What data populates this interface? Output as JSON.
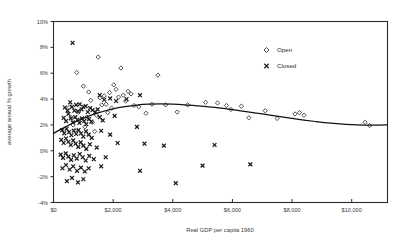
{
  "chart_data": {
    "type": "scatter",
    "title": "",
    "xlabel": "Real GDP per capita 1960",
    "ylabel": "average annual % growth",
    "xlim": [
      0,
      11200
    ],
    "ylim": [
      -4,
      10
    ],
    "grid": false,
    "legend_position": "top-right",
    "x_tick_labels": [
      "$0",
      "$2,000",
      "$4,000",
      "$6,000",
      "$8,000",
      "$10,000"
    ],
    "x_tick_values": [
      0,
      2000,
      4000,
      6000,
      8000,
      10000
    ],
    "y_tick_labels": [
      "10%",
      "8%",
      "6%",
      "4%",
      "2%",
      "0%",
      "-2%",
      "-4%"
    ],
    "y_tick_values": [
      10,
      8,
      6,
      4,
      2,
      0,
      -2,
      -4
    ],
    "series": [
      {
        "name": "Open",
        "marker": "diamond-open",
        "points": [
          [
            780,
            6.05
          ],
          [
            1000,
            5.0
          ],
          [
            1180,
            4.55
          ],
          [
            1250,
            3.9
          ],
          [
            1500,
            7.25
          ],
          [
            1560,
            4.1
          ],
          [
            1620,
            3.55
          ],
          [
            1700,
            4.25
          ],
          [
            1760,
            3.6
          ],
          [
            1820,
            2.95
          ],
          [
            1880,
            4.5
          ],
          [
            1950,
            3.3
          ],
          [
            2020,
            5.1
          ],
          [
            2100,
            4.75
          ],
          [
            2180,
            4.15
          ],
          [
            2260,
            6.4
          ],
          [
            2340,
            4.3
          ],
          [
            2420,
            3.85
          ],
          [
            2500,
            4.6
          ],
          [
            2600,
            4.4
          ],
          [
            2700,
            3.5
          ],
          [
            2860,
            3.4
          ],
          [
            3100,
            2.9
          ],
          [
            3300,
            3.6
          ],
          [
            3500,
            5.85
          ],
          [
            3760,
            3.55
          ],
          [
            4150,
            3.0
          ],
          [
            4500,
            3.55
          ],
          [
            5100,
            3.75
          ],
          [
            5500,
            3.7
          ],
          [
            5800,
            3.5
          ],
          [
            5950,
            3.2
          ],
          [
            6300,
            3.45
          ],
          [
            6550,
            2.55
          ],
          [
            7100,
            3.1
          ],
          [
            7500,
            2.5
          ],
          [
            8100,
            2.85
          ],
          [
            8250,
            2.95
          ],
          [
            8400,
            2.75
          ],
          [
            10450,
            2.2
          ],
          [
            10600,
            1.95
          ],
          [
            520,
            3.35
          ],
          [
            600,
            2.55
          ],
          [
            660,
            2.0
          ],
          [
            720,
            1.55
          ],
          [
            840,
            3.0
          ],
          [
            900,
            2.35
          ],
          [
            1050,
            1.85
          ],
          [
            1120,
            2.6
          ],
          [
            1300,
            2.2
          ],
          [
            1380,
            1.5
          ],
          [
            1440,
            2.75
          ]
        ]
      },
      {
        "name": "Closed",
        "marker": "x",
        "points": [
          [
            640,
            8.35
          ],
          [
            1550,
            4.3
          ],
          [
            1700,
            3.95
          ],
          [
            1900,
            4.05
          ],
          [
            2100,
            3.85
          ],
          [
            2450,
            4.0
          ],
          [
            2900,
            4.3
          ],
          [
            380,
            3.35
          ],
          [
            470,
            3.1
          ],
          [
            560,
            3.75
          ],
          [
            620,
            3.4
          ],
          [
            700,
            3.1
          ],
          [
            760,
            3.55
          ],
          [
            820,
            3.05
          ],
          [
            880,
            3.6
          ],
          [
            940,
            3.2
          ],
          [
            1000,
            3.4
          ],
          [
            1080,
            3.45
          ],
          [
            1150,
            3.0
          ],
          [
            1230,
            3.3
          ],
          [
            1310,
            3.15
          ],
          [
            1400,
            3.0
          ],
          [
            1480,
            3.2
          ],
          [
            340,
            2.55
          ],
          [
            420,
            2.3
          ],
          [
            500,
            2.85
          ],
          [
            580,
            2.5
          ],
          [
            650,
            2.2
          ],
          [
            730,
            2.6
          ],
          [
            800,
            2.4
          ],
          [
            870,
            2.15
          ],
          [
            950,
            2.5
          ],
          [
            1030,
            2.3
          ],
          [
            1100,
            2.05
          ],
          [
            1190,
            2.45
          ],
          [
            1270,
            2.25
          ],
          [
            1550,
            2.6
          ],
          [
            1650,
            2.35
          ],
          [
            2050,
            2.7
          ],
          [
            2800,
            1.85
          ],
          [
            290,
            1.6
          ],
          [
            360,
            1.35
          ],
          [
            440,
            1.7
          ],
          [
            520,
            1.45
          ],
          [
            600,
            1.2
          ],
          [
            680,
            1.55
          ],
          [
            760,
            1.3
          ],
          [
            840,
            1.6
          ],
          [
            920,
            1.35
          ],
          [
            1000,
            1.1
          ],
          [
            1090,
            1.5
          ],
          [
            1180,
            1.25
          ],
          [
            1280,
            1.0
          ],
          [
            1600,
            1.55
          ],
          [
            1900,
            1.25
          ],
          [
            260,
            0.85
          ],
          [
            340,
            0.6
          ],
          [
            420,
            0.95
          ],
          [
            500,
            0.7
          ],
          [
            580,
            0.45
          ],
          [
            660,
            0.8
          ],
          [
            740,
            0.55
          ],
          [
            830,
            0.3
          ],
          [
            910,
            0.65
          ],
          [
            1000,
            0.4
          ],
          [
            1100,
            0.15
          ],
          [
            1220,
            0.5
          ],
          [
            1450,
            0.25
          ],
          [
            2150,
            0.6
          ],
          [
            3050,
            0.55
          ],
          [
            3700,
            0.4
          ],
          [
            5400,
            0.45
          ],
          [
            240,
            -0.3
          ],
          [
            320,
            -0.55
          ],
          [
            410,
            -0.2
          ],
          [
            500,
            -0.45
          ],
          [
            590,
            -0.7
          ],
          [
            680,
            -0.35
          ],
          [
            780,
            -0.6
          ],
          [
            880,
            -0.25
          ],
          [
            980,
            -0.5
          ],
          [
            1080,
            -0.75
          ],
          [
            1200,
            -0.4
          ],
          [
            1350,
            -0.65
          ],
          [
            1750,
            -0.5
          ],
          [
            300,
            -1.35
          ],
          [
            420,
            -1.1
          ],
          [
            540,
            -1.45
          ],
          [
            660,
            -1.2
          ],
          [
            790,
            -1.55
          ],
          [
            920,
            -1.3
          ],
          [
            1050,
            -1.6
          ],
          [
            1180,
            -1.35
          ],
          [
            1600,
            -1.2
          ],
          [
            450,
            -2.35
          ],
          [
            620,
            -2.1
          ],
          [
            820,
            -2.45
          ],
          [
            1000,
            -2.2
          ],
          [
            2900,
            -1.55
          ],
          [
            5000,
            -1.15
          ],
          [
            6600,
            -1.05
          ],
          [
            4100,
            -2.5
          ]
        ]
      }
    ],
    "trend_line": {
      "name": "fitted-curve",
      "points": [
        [
          0,
          1.35
        ],
        [
          400,
          1.85
        ],
        [
          800,
          2.3
        ],
        [
          1200,
          2.7
        ],
        [
          1600,
          3.0
        ],
        [
          2000,
          3.25
        ],
        [
          2400,
          3.42
        ],
        [
          2800,
          3.54
        ],
        [
          3200,
          3.6
        ],
        [
          3600,
          3.62
        ],
        [
          4000,
          3.6
        ],
        [
          4400,
          3.55
        ],
        [
          4800,
          3.48
        ],
        [
          5200,
          3.4
        ],
        [
          5600,
          3.3
        ],
        [
          6000,
          3.18
        ],
        [
          6400,
          3.05
        ],
        [
          6800,
          2.92
        ],
        [
          7200,
          2.78
        ],
        [
          7600,
          2.64
        ],
        [
          8000,
          2.5
        ],
        [
          8400,
          2.38
        ],
        [
          8800,
          2.26
        ],
        [
          9200,
          2.16
        ],
        [
          9600,
          2.08
        ],
        [
          10000,
          2.02
        ],
        [
          10400,
          1.99
        ],
        [
          10800,
          1.98
        ],
        [
          11200,
          2.0
        ]
      ]
    },
    "legend": [
      {
        "label": "Open",
        "marker": "diamond-open"
      },
      {
        "label": "Closed",
        "marker": "x"
      }
    ]
  },
  "colors": {
    "marker_stroke": "#2f2f2f",
    "axis": "#2b2b2b",
    "text": "#3a3a3a",
    "trend": "#111111",
    "background": "#ffffff"
  }
}
